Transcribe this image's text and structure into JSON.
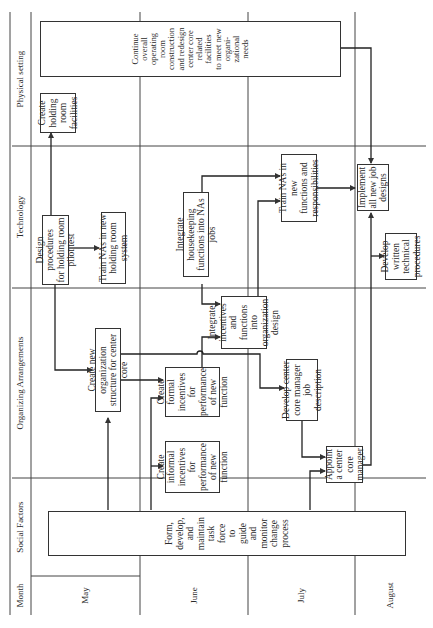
{
  "lanes": {
    "header": "Month",
    "items": [
      {
        "id": "social",
        "label": "Social Factors"
      },
      {
        "id": "org",
        "label": "Organizing Arrangements"
      },
      {
        "id": "tech",
        "label": "Technology"
      },
      {
        "id": "phys",
        "label": "Physical setting"
      }
    ]
  },
  "months": [
    "May",
    "June",
    "July",
    "August"
  ],
  "boxes": {
    "task_force": "Form,\ndevelop,\nand\nmaintain\ntask\nforce\nto\nguide\nand\nmonitor\nchange\nprocess",
    "informal_incentives": "Create\ninformal\nincentives for\nperformance\nof new\nfunction",
    "appoint_manager": "Appoint\na center\ncore\nmanager",
    "new_org_structure": "Create new organization\nstructure for center core",
    "formal_incentives": "Create\nformal\nincentives for\nperformance\nof new\nfunction",
    "integrate_incentives": "Integrate\nincentives and\nfunctions into\norganization\ndesign",
    "manager_job_desc": "Develop center\ncore manager job\ndescription",
    "design_procedures": "Design procedures\nfor holding room\npilot test",
    "train_holding": "Train NAs in new\nholding room system",
    "integrate_housekeeping": "Integrate housekeeping\nfunctions into NAs jobs",
    "train_new_functions": "Train NAs in new\nfunctions and\nresponsibilities",
    "implement_jobs": "Implement\nall new job\ndesigns",
    "technical_procedures": "Develop\nwritten\ntechnical\nprocedures",
    "holding_room_facilities": "Create\nholding\nroom\nfacilities",
    "continue_construction": "Continue\noverall\noperating\nroom\nconstruction\nand redesign\ncenter core\nrelated\nfacilities\nto meet new\norgani-\nzational\nneeds"
  },
  "colors": {
    "line": "#333333",
    "background": "#ffffff",
    "text": "#2a2a2a"
  }
}
